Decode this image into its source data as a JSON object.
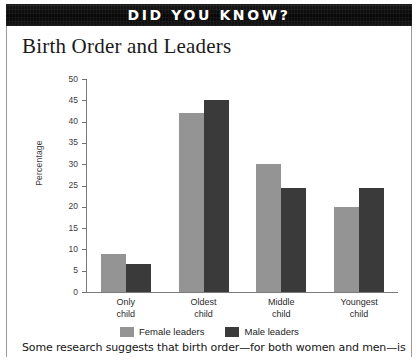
{
  "banner": {
    "title": "DID YOU KNOW?"
  },
  "caption": {
    "text": "Some research suggests that birth order—for both women and men—is"
  },
  "legend": {
    "items": [
      {
        "label": "Female leaders",
        "color": "#949494",
        "swatch": "legend-swatch-female"
      },
      {
        "label": "Male leaders",
        "color": "#3a3a3a",
        "swatch": "legend-swatch-male"
      }
    ]
  },
  "colors": {
    "female": "#949494",
    "male": "#3a3a3a",
    "banner_background": "#0d0d0d",
    "banner_text": "#ffffff",
    "axis": "#7a7a7a",
    "background": "#ffffff"
  },
  "chart_data": {
    "type": "bar",
    "title": "Birth Order and Leaders",
    "xlabel": "",
    "ylabel": "Percentage",
    "ylim": [
      0,
      50
    ],
    "yticks": [
      0,
      5,
      10,
      15,
      20,
      25,
      30,
      35,
      40,
      45,
      50
    ],
    "ytick_labels": [
      "0",
      "5",
      "10",
      "15",
      "20",
      "25",
      "30",
      "35",
      "40",
      "45",
      "50"
    ],
    "grid": false,
    "legend_position": "bottom",
    "categories": [
      "Only child",
      "Oldest child",
      "Middle child",
      "Youngest child"
    ],
    "category_lines": [
      [
        "Only",
        "child"
      ],
      [
        "Oldest",
        "child"
      ],
      [
        "Middle",
        "child"
      ],
      [
        "Youngest",
        "child"
      ]
    ],
    "series": [
      {
        "name": "Female leaders",
        "color": "#949494",
        "values": [
          9,
          42,
          30,
          20
        ]
      },
      {
        "name": "Male leaders",
        "color": "#3a3a3a",
        "values": [
          6.5,
          45,
          24.3,
          24.3
        ]
      }
    ]
  }
}
